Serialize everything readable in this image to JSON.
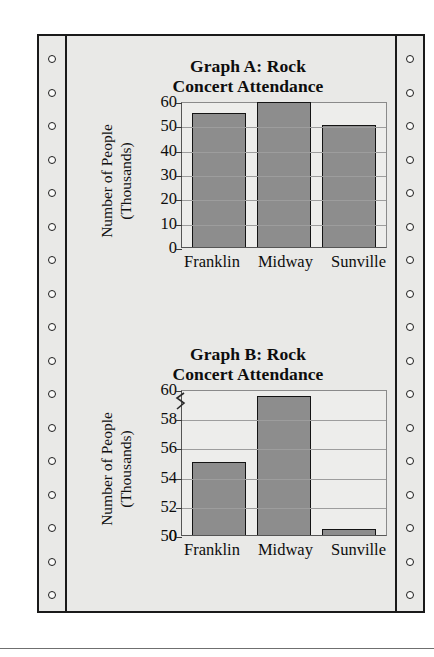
{
  "page": {
    "paper_color": "#e9e9e7",
    "ink_color": "#0d0d0d",
    "bar_color": "#8d8d8d",
    "sprocket_hole_count": 17
  },
  "chart_data": [
    {
      "type": "bar",
      "id": "graph-a",
      "title": "Graph A: Rock Concert Attendance",
      "title_lines": [
        "Graph A: Rock",
        "Concert Attendance"
      ],
      "categories": [
        "Franklin",
        "Midway",
        "Sunville"
      ],
      "values": [
        55,
        59.5,
        50
      ],
      "xlabel": "",
      "ylabel": "Number of People (Thousands)",
      "ylabel_lines": [
        "Number of People",
        "(Thousands)"
      ],
      "ylim": [
        0,
        60
      ],
      "yticks": [
        60,
        50,
        40,
        30,
        20,
        10,
        0
      ],
      "ytick_labels": [
        "60",
        "50",
        "40",
        "30",
        "20",
        "10",
        "0"
      ],
      "grid": true,
      "axis_break": false,
      "legend": "none"
    },
    {
      "type": "bar",
      "id": "graph-b",
      "title": "Graph B: Rock Concert Attendance",
      "title_lines": [
        "Graph B: Rock",
        "Concert Attendance"
      ],
      "categories": [
        "Franklin",
        "Midway",
        "Sunville"
      ],
      "values": [
        55,
        59.5,
        50.2
      ],
      "xlabel": "",
      "ylabel": "Number of People (Thousands)",
      "ylabel_lines": [
        "Number of People",
        "(Thousands)"
      ],
      "ylim": [
        50,
        60
      ],
      "yticks": [
        60,
        58,
        56,
        54,
        52,
        50,
        0
      ],
      "ytick_labels": [
        "60",
        "58",
        "56",
        "54",
        "52",
        "50",
        "0"
      ],
      "grid": true,
      "axis_break": true,
      "axis_break_note": "y-axis truncated between 0 and 50",
      "legend": "none"
    }
  ]
}
